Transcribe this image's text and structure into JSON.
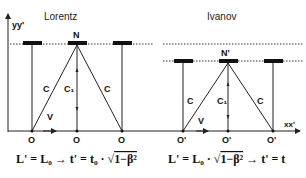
{
  "axes": {
    "y_label": "yy'",
    "x_label": "xx'"
  },
  "left_panel": {
    "title": "Lorentz",
    "mirror_label": "N",
    "light_labels": [
      "C",
      "C₁",
      "C"
    ],
    "velocity_label": "V",
    "origin_labels": [
      "O",
      "O",
      "O"
    ],
    "formula_left": "L' = L₀ → t' = t₀ · ",
    "formula_sqrt": "1−β²",
    "formula_right": ""
  },
  "right_panel": {
    "title": "Ivanov",
    "mirror_label": "N'",
    "light_labels": [
      "C",
      "C₁",
      "C"
    ],
    "velocity_label": "V",
    "origin_labels": [
      "O'",
      "O'",
      "O'"
    ],
    "formula_left": "L' = L₀ · ",
    "formula_sqrt": "1−β²",
    "formula_right": " → t' = t"
  },
  "colors": {
    "line": "#222222",
    "mirror": "#111111",
    "dotted": "#333333"
  }
}
